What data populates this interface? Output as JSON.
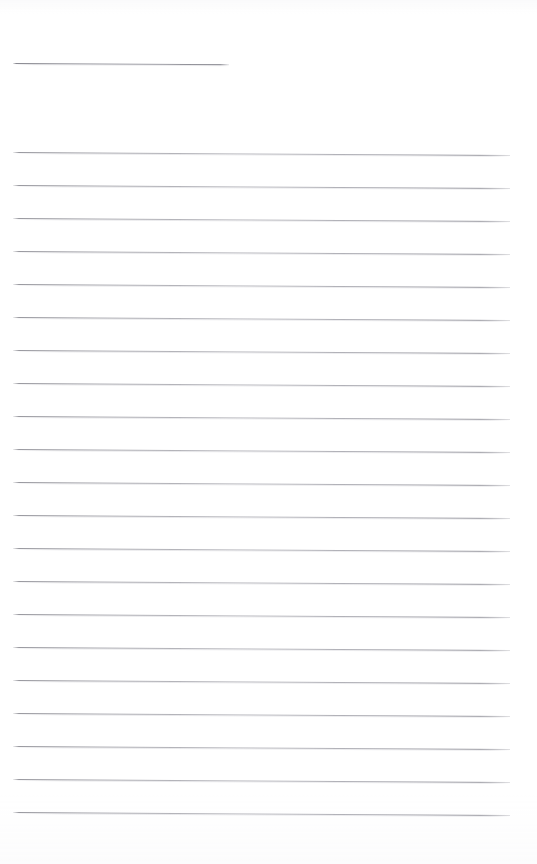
{
  "document": {
    "kind": "blank-ruled-paper",
    "title_rule_present": true,
    "page_width": 537,
    "page_height": 864,
    "background_color": "#ffffff",
    "rule_color": "#9a9aa2",
    "rule_halo_color": "#c7c7cd",
    "rule_thickness_px": 1,
    "rule_spacing_px": 33,
    "skew_degrees": 0.34,
    "content_text": "",
    "visible_text_count": 0
  },
  "header_rule": {
    "name": "title-rule",
    "x": 13,
    "y": 63,
    "width": 216
  },
  "body_rules": {
    "left_x": 13,
    "width": 497,
    "start_y": 152,
    "spacing": 33,
    "count": 21,
    "lines": [
      {
        "index": 1,
        "y": 152
      },
      {
        "index": 2,
        "y": 185
      },
      {
        "index": 3,
        "y": 218
      },
      {
        "index": 4,
        "y": 251
      },
      {
        "index": 5,
        "y": 284
      },
      {
        "index": 6,
        "y": 317
      },
      {
        "index": 7,
        "y": 350
      },
      {
        "index": 8,
        "y": 383
      },
      {
        "index": 9,
        "y": 416
      },
      {
        "index": 10,
        "y": 449
      },
      {
        "index": 11,
        "y": 482
      },
      {
        "index": 12,
        "y": 515
      },
      {
        "index": 13,
        "y": 548
      },
      {
        "index": 14,
        "y": 581
      },
      {
        "index": 15,
        "y": 614
      },
      {
        "index": 16,
        "y": 647
      },
      {
        "index": 17,
        "y": 680
      },
      {
        "index": 18,
        "y": 713
      },
      {
        "index": 19,
        "y": 746
      },
      {
        "index": 20,
        "y": 779
      },
      {
        "index": 21,
        "y": 812
      }
    ]
  }
}
